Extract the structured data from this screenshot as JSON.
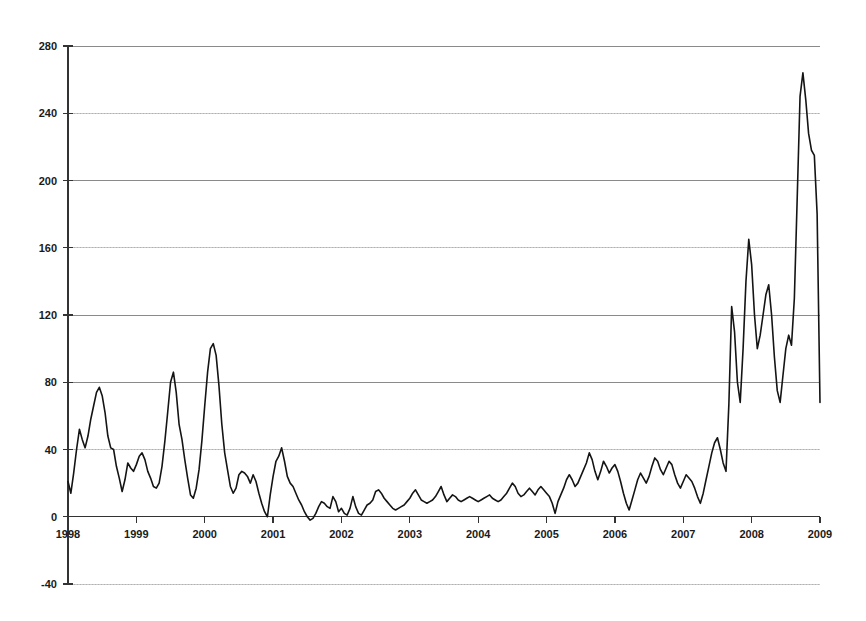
{
  "chart_data": {
    "type": "line",
    "title": "",
    "subtitle": "",
    "xlabel": "",
    "ylabel": "",
    "xlim": [
      1998,
      2009
    ],
    "ylim": [
      -40,
      280
    ],
    "ytick_step": 40,
    "xtick_step": 1,
    "grid": true,
    "grid_axis": "y",
    "legend": false,
    "legend_position": "none",
    "line_color": "#141414",
    "background_color": "#ffffff",
    "gridline_color": "#8a8a8a",
    "axis_color": "#333333",
    "ytick_labels": [
      "280",
      "240",
      "200",
      "160",
      "120",
      "80",
      "40",
      "0",
      "-40"
    ],
    "ytick_values": [
      280,
      240,
      200,
      160,
      120,
      80,
      40,
      0,
      -40
    ],
    "xtick_labels": [
      "1998",
      "1999",
      "2000",
      "2001",
      "2002",
      "2003",
      "2004",
      "2005",
      "2006",
      "2007",
      "2008",
      "2009"
    ],
    "xtick_values": [
      1998,
      1999,
      2000,
      2001,
      2002,
      2003,
      2004,
      2005,
      2006,
      2007,
      2008,
      2009
    ],
    "series": [
      {
        "name": "series-1",
        "color": "#141414",
        "x": [
          1998.0,
          1998.042,
          1998.083,
          1998.125,
          1998.167,
          1998.208,
          1998.25,
          1998.292,
          1998.333,
          1998.375,
          1998.417,
          1998.458,
          1998.5,
          1998.542,
          1998.583,
          1998.625,
          1998.667,
          1998.708,
          1998.75,
          1998.792,
          1998.833,
          1998.875,
          1998.917,
          1998.958,
          1999.0,
          1999.042,
          1999.083,
          1999.125,
          1999.167,
          1999.208,
          1999.25,
          1999.292,
          1999.333,
          1999.375,
          1999.417,
          1999.458,
          1999.5,
          1999.542,
          1999.583,
          1999.625,
          1999.667,
          1999.708,
          1999.75,
          1999.792,
          1999.833,
          1999.875,
          1999.917,
          1999.958,
          2000.0,
          2000.042,
          2000.083,
          2000.125,
          2000.167,
          2000.208,
          2000.25,
          2000.292,
          2000.333,
          2000.375,
          2000.417,
          2000.458,
          2000.5,
          2000.542,
          2000.583,
          2000.625,
          2000.667,
          2000.708,
          2000.75,
          2000.792,
          2000.833,
          2000.875,
          2000.917,
          2000.958,
          2001.0,
          2001.042,
          2001.083,
          2001.125,
          2001.167,
          2001.208,
          2001.25,
          2001.292,
          2001.333,
          2001.375,
          2001.417,
          2001.458,
          2001.5,
          2001.542,
          2001.583,
          2001.625,
          2001.667,
          2001.708,
          2001.75,
          2001.792,
          2001.833,
          2001.875,
          2001.917,
          2001.958,
          2002.0,
          2002.042,
          2002.083,
          2002.125,
          2002.167,
          2002.208,
          2002.25,
          2002.292,
          2002.333,
          2002.375,
          2002.417,
          2002.458,
          2002.5,
          2002.542,
          2002.583,
          2002.625,
          2002.667,
          2002.708,
          2002.75,
          2002.792,
          2002.833,
          2002.875,
          2002.917,
          2002.958,
          2003.0,
          2003.042,
          2003.083,
          2003.125,
          2003.167,
          2003.208,
          2003.25,
          2003.292,
          2003.333,
          2003.375,
          2003.417,
          2003.458,
          2003.5,
          2003.542,
          2003.583,
          2003.625,
          2003.667,
          2003.708,
          2003.75,
          2003.792,
          2003.833,
          2003.875,
          2003.917,
          2003.958,
          2004.0,
          2004.042,
          2004.083,
          2004.125,
          2004.167,
          2004.208,
          2004.25,
          2004.292,
          2004.333,
          2004.375,
          2004.417,
          2004.458,
          2004.5,
          2004.542,
          2004.583,
          2004.625,
          2004.667,
          2004.708,
          2004.75,
          2004.792,
          2004.833,
          2004.875,
          2004.917,
          2004.958,
          2005.0,
          2005.042,
          2005.083,
          2005.125,
          2005.167,
          2005.208,
          2005.25,
          2005.292,
          2005.333,
          2005.375,
          2005.417,
          2005.458,
          2005.5,
          2005.542,
          2005.583,
          2005.625,
          2005.667,
          2005.708,
          2005.75,
          2005.792,
          2005.833,
          2005.875,
          2005.917,
          2005.958,
          2006.0,
          2006.042,
          2006.083,
          2006.125,
          2006.167,
          2006.208,
          2006.25,
          2006.292,
          2006.333,
          2006.375,
          2006.417,
          2006.458,
          2006.5,
          2006.542,
          2006.583,
          2006.625,
          2006.667,
          2006.708,
          2006.75,
          2006.792,
          2006.833,
          2006.875,
          2006.917,
          2006.958,
          2007.0,
          2007.042,
          2007.083,
          2007.125,
          2007.167,
          2007.208,
          2007.25,
          2007.292,
          2007.333,
          2007.375,
          2007.417,
          2007.458,
          2007.5,
          2007.542,
          2007.583,
          2007.625,
          2007.667,
          2007.708,
          2007.75,
          2007.792,
          2007.833,
          2007.875,
          2007.917,
          2007.958,
          2008.0,
          2008.042,
          2008.083,
          2008.125,
          2008.167,
          2008.208,
          2008.25,
          2008.292,
          2008.333,
          2008.375,
          2008.417,
          2008.458,
          2008.5,
          2008.542,
          2008.583,
          2008.625,
          2008.667,
          2008.708,
          2008.75,
          2008.792,
          2008.833,
          2008.875,
          2008.917,
          2008.958,
          2009.0
        ],
        "values": [
          21,
          14,
          26,
          40,
          52,
          46,
          41,
          48,
          58,
          66,
          74,
          77,
          72,
          62,
          48,
          41,
          40,
          30,
          23,
          15,
          22,
          32,
          29,
          27,
          31,
          36,
          38,
          34,
          27,
          23,
          18,
          17,
          20,
          30,
          45,
          62,
          80,
          86,
          74,
          55,
          46,
          34,
          23,
          13,
          11,
          17,
          28,
          45,
          66,
          86,
          100,
          103,
          96,
          78,
          55,
          38,
          28,
          18,
          14,
          17,
          25,
          27,
          26,
          24,
          20,
          25,
          21,
          14,
          8,
          3,
          0,
          13,
          24,
          33,
          36,
          41,
          33,
          24,
          20,
          18,
          14,
          10,
          7,
          3,
          0,
          -2,
          -1,
          2,
          6,
          9,
          8,
          6,
          5,
          12,
          9,
          3,
          5,
          2,
          1,
          5,
          12,
          6,
          2,
          1,
          4,
          7,
          8,
          10,
          15,
          16,
          14,
          11,
          9,
          7,
          5,
          4,
          5,
          6,
          7,
          9,
          11,
          14,
          16,
          13,
          10,
          9,
          8,
          9,
          10,
          12,
          15,
          18,
          13,
          9,
          11,
          13,
          12,
          10,
          9,
          10,
          11,
          12,
          11,
          10,
          9,
          10,
          11,
          12,
          13,
          11,
          10,
          9,
          10,
          12,
          14,
          17,
          20,
          18,
          14,
          12,
          13,
          15,
          17,
          15,
          13,
          16,
          18,
          16,
          14,
          12,
          8,
          2,
          9,
          13,
          17,
          22,
          25,
          22,
          18,
          20,
          24,
          28,
          32,
          38,
          34,
          27,
          22,
          27,
          33,
          30,
          26,
          29,
          31,
          27,
          21,
          14,
          8,
          4,
          10,
          16,
          22,
          26,
          23,
          20,
          24,
          30,
          35,
          33,
          28,
          25,
          29,
          33,
          31,
          25,
          20,
          17,
          21,
          25,
          23,
          21,
          17,
          12,
          8,
          14,
          22,
          30,
          38,
          44,
          47,
          40,
          32,
          27,
          67,
          125,
          110,
          80,
          68,
          100,
          140,
          165,
          150,
          120,
          100,
          108,
          120,
          132,
          138,
          120,
          95,
          75,
          68,
          84,
          100,
          108,
          102,
          130,
          190,
          250,
          264,
          248,
          228,
          218,
          215,
          180,
          68
        ]
      }
    ]
  },
  "figure": {
    "width": 866,
    "height": 621,
    "plot_left": 68,
    "plot_right": 820,
    "plot_top": 46,
    "plot_bottom": 584
  }
}
